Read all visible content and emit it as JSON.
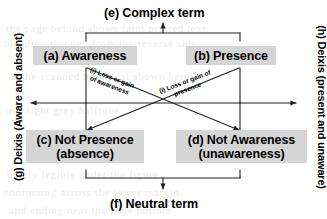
{
  "diagram": {
    "type": "semiotic-square",
    "title_top": "(e) Complex term",
    "title_bottom": "(f) Neutral term",
    "nodes": [
      {
        "id": "a",
        "label": "(a) Awareness",
        "sub": ""
      },
      {
        "id": "b",
        "label": "(b) Presence",
        "sub": ""
      },
      {
        "id": "c",
        "label": "(c) Not Presence",
        "sub": "(absence)"
      },
      {
        "id": "d",
        "label": "(d) Not Awareness",
        "sub": "(unawareness)"
      }
    ],
    "diagonal_labels": [
      {
        "id": "i1",
        "line1": "(i) Loss or gain",
        "line2": "of awareness"
      },
      {
        "id": "i2",
        "line1": "(i) Loss or gain of",
        "line2": "presence"
      }
    ],
    "side_labels": {
      "left": "(g) Deixis (Aware and absent)",
      "right": "(h) Deixis (present and unaware)"
    },
    "colors": {
      "box_fill": "#d5d5d5",
      "text": "#000000",
      "line": "#222222",
      "background": "#ffffff"
    }
  },
  "background_text": {
    "lines": [
      "the page behind shows faint printed text",
      "bleeding through from the reverse side",
      "of the scanned book leaf shown here",
      "in a light grey halftone",
      "barely legible under the figure",
      "continuing across the lower margin",
      "and ending near the page bottom"
    ]
  }
}
